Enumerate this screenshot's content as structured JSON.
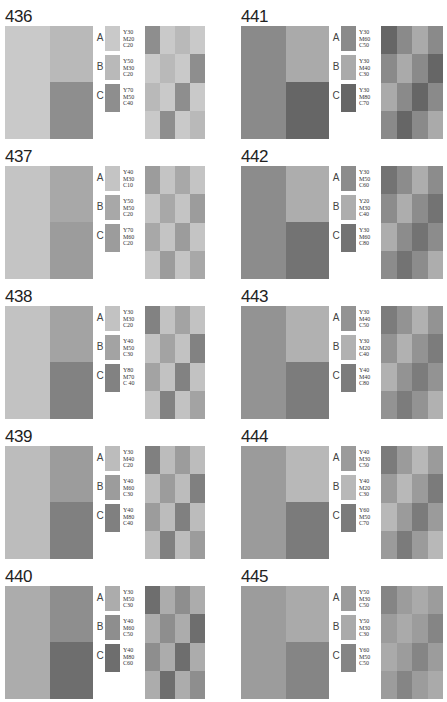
{
  "grid_pattern": [
    [
      "C",
      "A",
      "B",
      "A"
    ],
    [
      "A",
      "B",
      "A",
      "C"
    ],
    [
      "B",
      "A",
      "C",
      "A"
    ],
    [
      "A",
      "C",
      "A",
      "B"
    ]
  ],
  "panels": [
    {
      "number": "436",
      "col": 0,
      "row": 0,
      "big": {
        "left": "A",
        "right_top": "B",
        "right_bottom": "C"
      },
      "swatches": [
        {
          "label": "A",
          "cmy": [
            "Y30",
            "M20",
            "C20"
          ],
          "color": "#c9c9c9"
        },
        {
          "label": "B",
          "cmy": [
            "Y50",
            "M30",
            "C20"
          ],
          "color": "#b9b9b9"
        },
        {
          "label": "C",
          "cmy": [
            "Y70",
            "M50",
            "C40"
          ],
          "color": "#8e8e8e"
        }
      ]
    },
    {
      "number": "437",
      "col": 0,
      "row": 1,
      "big": {
        "left": "A",
        "right_top": "B",
        "right_bottom": "C"
      },
      "swatches": [
        {
          "label": "A",
          "cmy": [
            "Y40",
            "M30",
            "C10"
          ],
          "color": "#c4c4c4"
        },
        {
          "label": "B",
          "cmy": [
            "Y50",
            "M50",
            "C20"
          ],
          "color": "#a8a8a8"
        },
        {
          "label": "C",
          "cmy": [
            "Y70",
            "M60",
            "C20"
          ],
          "color": "#9c9c9c"
        }
      ]
    },
    {
      "number": "438",
      "col": 0,
      "row": 2,
      "big": {
        "left": "A",
        "right_top": "B",
        "right_bottom": "C"
      },
      "swatches": [
        {
          "label": "A",
          "cmy": [
            "Y30",
            "M30",
            "C20"
          ],
          "color": "#c2c2c2"
        },
        {
          "label": "B",
          "cmy": [
            "Y40",
            "M50",
            "C30"
          ],
          "color": "#a3a3a3"
        },
        {
          "label": "C",
          "cmy": [
            "Y80",
            "M70",
            "C 40"
          ],
          "color": "#828282"
        }
      ]
    },
    {
      "number": "439",
      "col": 0,
      "row": 3,
      "big": {
        "left": "A",
        "right_top": "B",
        "right_bottom": "C"
      },
      "swatches": [
        {
          "label": "A",
          "cmy": [
            "Y30",
            "M40",
            "C20"
          ],
          "color": "#bcbcbc"
        },
        {
          "label": "B",
          "cmy": [
            "Y40",
            "M60",
            "C30"
          ],
          "color": "#9c9c9c"
        },
        {
          "label": "C",
          "cmy": [
            "Y40",
            "M80",
            "C40"
          ],
          "color": "#808080"
        }
      ]
    },
    {
      "number": "440",
      "col": 0,
      "row": 4,
      "big": {
        "left": "A",
        "right_top": "B",
        "right_bottom": "C"
      },
      "swatches": [
        {
          "label": "A",
          "cmy": [
            "Y30",
            "M50",
            "C30"
          ],
          "color": "#acacac"
        },
        {
          "label": "B",
          "cmy": [
            "Y40",
            "M60",
            "C50"
          ],
          "color": "#8e8e8e"
        },
        {
          "label": "C",
          "cmy": [
            "Y40",
            "M80",
            "C60"
          ],
          "color": "#6e6e6e"
        }
      ]
    },
    {
      "number": "441",
      "col": 1,
      "row": 0,
      "big": {
        "left": "A",
        "right_top": "B",
        "right_bottom": "C"
      },
      "swatches": [
        {
          "label": "A",
          "cmy": [
            "Y30",
            "M60",
            "C50"
          ],
          "color": "#8a8a8a"
        },
        {
          "label": "B",
          "cmy": [
            "Y30",
            "M40",
            "C30"
          ],
          "color": "#aaaaaa"
        },
        {
          "label": "C",
          "cmy": [
            "Y30",
            "M80",
            "C70"
          ],
          "color": "#666666"
        }
      ]
    },
    {
      "number": "442",
      "col": 1,
      "row": 1,
      "big": {
        "left": "A",
        "right_top": "B",
        "right_bottom": "C"
      },
      "swatches": [
        {
          "label": "A",
          "cmy": [
            "Y30",
            "M50",
            "C60"
          ],
          "color": "#8c8c8c"
        },
        {
          "label": "B",
          "cmy": [
            "Y20",
            "M30",
            "C40"
          ],
          "color": "#adadad"
        },
        {
          "label": "C",
          "cmy": [
            "Y30",
            "M60",
            "C80"
          ],
          "color": "#737373"
        }
      ]
    },
    {
      "number": "443",
      "col": 1,
      "row": 2,
      "big": {
        "left": "A",
        "right_top": "B",
        "right_bottom": "C"
      },
      "swatches": [
        {
          "label": "A",
          "cmy": [
            "Y30",
            "M40",
            "C50"
          ],
          "color": "#939393"
        },
        {
          "label": "B",
          "cmy": [
            "Y30",
            "M20",
            "C40"
          ],
          "color": "#b1b1b1"
        },
        {
          "label": "C",
          "cmy": [
            "Y40",
            "M40",
            "C80"
          ],
          "color": "#7c7c7c"
        }
      ]
    },
    {
      "number": "444",
      "col": 1,
      "row": 3,
      "big": {
        "left": "A",
        "right_top": "B",
        "right_bottom": "C"
      },
      "swatches": [
        {
          "label": "A",
          "cmy": [
            "Y40",
            "M30",
            "C50"
          ],
          "color": "#9b9b9b"
        },
        {
          "label": "B",
          "cmy": [
            "Y40",
            "M20",
            "C30"
          ],
          "color": "#b8b8b8"
        },
        {
          "label": "C",
          "cmy": [
            "Y60",
            "M50",
            "C70"
          ],
          "color": "#7b7b7b"
        }
      ]
    },
    {
      "number": "445",
      "col": 1,
      "row": 4,
      "big": {
        "left": "A",
        "right_top": "B",
        "right_bottom": "C"
      },
      "swatches": [
        {
          "label": "A",
          "cmy": [
            "Y50",
            "M30",
            "C50"
          ],
          "color": "#9c9c9c"
        },
        {
          "label": "B",
          "cmy": [
            "Y50",
            "M30",
            "C30"
          ],
          "color": "#aaaaaa"
        },
        {
          "label": "C",
          "cmy": [
            "Y60",
            "M50",
            "C50"
          ],
          "color": "#858585"
        }
      ]
    }
  ]
}
